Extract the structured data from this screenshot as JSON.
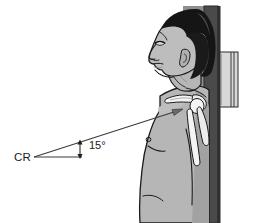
{
  "figure": {
    "labels": {
      "central_ray": "CR",
      "angle": "15°"
    },
    "annotations": {
      "arrow_target": "shoulder-joint",
      "ray_direction": "cephalad"
    },
    "colors": {
      "background": "#ffffff",
      "skin": "#b3b3b3",
      "skin_shadow": "#9a9a9a",
      "skin_light": "#c4c4c4",
      "hair": "#1a1a1a",
      "hair_highlight": "#4d4d4d",
      "bone": "#f2f2f2",
      "outline": "#1a1a1a",
      "wall_dark": "#4a4a4a",
      "wall_mid": "#8c8c8c",
      "cassette": "#d8d8d8",
      "leader_line": "#444444",
      "text": "#1a1a1a"
    },
    "parts": [
      {
        "name": "head",
        "label": "Head in lateral profile"
      },
      {
        "name": "hair",
        "label": "Hair"
      },
      {
        "name": "ear",
        "label": "Ear"
      },
      {
        "name": "neck",
        "label": "Neck"
      },
      {
        "name": "torso",
        "label": "Torso"
      },
      {
        "name": "clavicle",
        "label": "Clavicle"
      },
      {
        "name": "scapula",
        "label": "Scapula"
      },
      {
        "name": "humerus",
        "label": "Humerus"
      },
      {
        "name": "wall-bucky",
        "label": "Upright wall bucky"
      },
      {
        "name": "cassette",
        "label": "Image receptor cassette"
      },
      {
        "name": "central-ray-line",
        "label": "Central ray line"
      },
      {
        "name": "angle-bracket",
        "label": "Angle measure bracket"
      }
    ]
  }
}
